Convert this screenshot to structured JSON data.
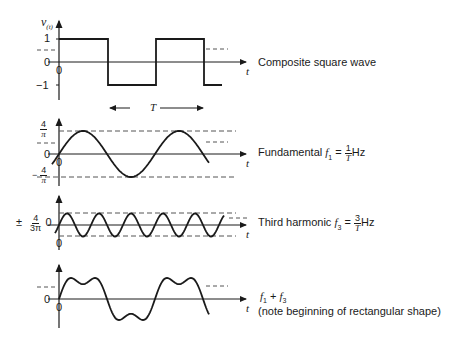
{
  "diagram": {
    "panels": [
      {
        "id": "square",
        "y_axis_label": "v",
        "y_axis_sub": "(t)",
        "ticks": [
          "1",
          "0",
          "−1"
        ],
        "origin_label": "0",
        "x_axis_label": "t",
        "caption": "Composite square wave"
      },
      {
        "id": "fundamental",
        "tick_top_num": "4",
        "tick_top_den": "π",
        "tick_zero": "0",
        "tick_bottom_sign": "−",
        "tick_bottom_num": "4",
        "tick_bottom_den": "π",
        "origin_label": "0",
        "x_axis_label": "t",
        "caption_prefix": "Fundamental ",
        "caption_var": "f",
        "caption_sub": "1",
        "caption_eq": " = ",
        "caption_frac_num": "1",
        "caption_frac_den": "T",
        "caption_unit": "Hz"
      },
      {
        "id": "third",
        "tick_pm": "±",
        "tick_num": "4",
        "tick_den": "3π",
        "tick_zero": "0",
        "origin_label": "0",
        "x_axis_label": "t",
        "caption_prefix": "Third harmonic ",
        "caption_var": "f",
        "caption_sub": "3",
        "caption_eq": " = ",
        "caption_frac_num": "3",
        "caption_frac_den": "T",
        "caption_unit": "Hz"
      },
      {
        "id": "sum",
        "tick_zero": "0",
        "origin_label": "0",
        "x_axis_label": "t",
        "caption_line1_a": "f",
        "caption_line1_sub_a": "1",
        "caption_line1_plus": " + ",
        "caption_line1_b": "f",
        "caption_line1_sub_b": "3",
        "caption_line2": "(note beginning of rectangular shape)"
      }
    ],
    "period_label": "T"
  },
  "chart_data": {
    "type": "line",
    "xlabel": "t",
    "series": [
      {
        "name": "Composite square wave",
        "shape": "square",
        "amplitude": 1,
        "cycles_shown": 1.4
      },
      {
        "name": "Fundamental f1 = 1/T Hz",
        "shape": "sine",
        "amplitude": "4/π",
        "cycles_shown": 1.4
      },
      {
        "name": "Third harmonic f3 = 3/T Hz",
        "shape": "sine",
        "amplitude": "4/(3π)",
        "cycles_shown": 4.3
      },
      {
        "name": "f1 + f3 (note beginning of rectangular shape)",
        "shape": "sum",
        "components": [
          "f1",
          "f3"
        ]
      }
    ],
    "annotations": [
      "T (one period)",
      "dashed reference lines at ±1, ±4/π, ±4/(3π)"
    ]
  }
}
